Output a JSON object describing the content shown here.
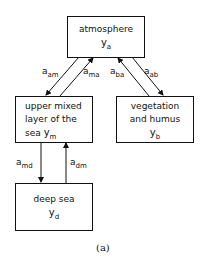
{
  "diagram": {
    "nodes": {
      "atmosphere": {
        "label": "atmosphere",
        "symbol": "y",
        "sub": "a"
      },
      "upper_mixed": {
        "label_lines": [
          "upper mixed",
          "layer of the",
          "sea"
        ],
        "symbol": "y",
        "sub": "m"
      },
      "vegetation": {
        "label_lines": [
          "vegetation",
          "and humus"
        ],
        "symbol": "y",
        "sub": "b"
      },
      "deep_sea": {
        "label": "deep sea",
        "symbol": "y",
        "sub": "d"
      }
    },
    "edges": [
      {
        "from": "atmosphere",
        "to": "upper_mixed",
        "label": "a",
        "sub": "am"
      },
      {
        "from": "upper_mixed",
        "to": "atmosphere",
        "label": "a",
        "sub": "ma"
      },
      {
        "from": "vegetation",
        "to": "atmosphere",
        "label": "a",
        "sub": "ba"
      },
      {
        "from": "atmosphere",
        "to": "vegetation",
        "label": "a",
        "sub": "ab"
      },
      {
        "from": "upper_mixed",
        "to": "deep_sea",
        "label": "a",
        "sub": "md"
      },
      {
        "from": "deep_sea",
        "to": "upper_mixed",
        "label": "a",
        "sub": "dm"
      }
    ],
    "caption": "(a)"
  }
}
